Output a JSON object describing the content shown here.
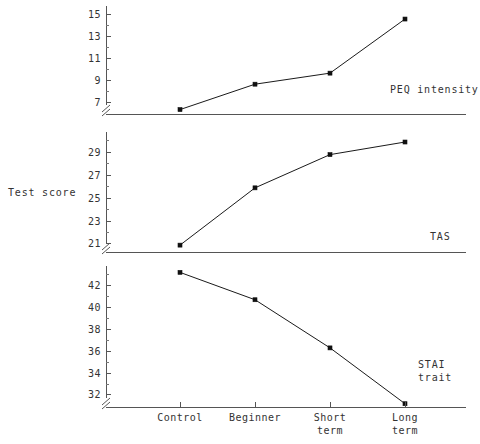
{
  "figure": {
    "y_axis_title": "Test score",
    "background": "#ffffff",
    "line_color": "#1a1a1a",
    "axis_color": "#555555",
    "text_color": "#333333"
  },
  "chart_data": {
    "type": "line",
    "title": "",
    "xlabel": "",
    "ylabel": "Test score",
    "grid": false,
    "legend": "inline-right-panel-labels",
    "categories": [
      "Control",
      "Beginner",
      "Short term",
      "Long term"
    ],
    "category_lines": [
      [
        "Control"
      ],
      [
        "Beginner"
      ],
      [
        "Short",
        "term"
      ],
      [
        "Long",
        "term"
      ]
    ],
    "panels": [
      {
        "name": "PEQ intensity",
        "label": "PEQ intensity",
        "label_lines": [
          "PEQ intensity"
        ],
        "ylim": [
          6.0,
          15.6
        ],
        "yticks": [
          7,
          9,
          11,
          13,
          15
        ],
        "ytick_labels": [
          "7",
          "9",
          "11",
          "13",
          "15"
        ],
        "minor_ticks": [
          8,
          10,
          12,
          14
        ],
        "axis_break": true,
        "values": [
          6.4,
          8.7,
          9.7,
          14.6
        ]
      },
      {
        "name": "TAS",
        "label": "TAS",
        "label_lines": [
          "TAS"
        ],
        "ylim": [
          20.3,
          30.6
        ],
        "yticks": [
          21,
          23,
          25,
          27,
          29
        ],
        "ytick_labels": [
          "21",
          "23",
          "25",
          "27",
          "29"
        ],
        "minor_ticks": [
          22,
          24,
          26,
          28,
          30
        ],
        "axis_break": true,
        "values": [
          20.9,
          25.9,
          28.8,
          29.9
        ]
      },
      {
        "name": "STAI trait",
        "label": "STAI trait",
        "label_lines": [
          "STAI",
          "trait"
        ],
        "ylim": [
          30.9,
          43.6
        ],
        "yticks": [
          32,
          34,
          36,
          38,
          40,
          42
        ],
        "ytick_labels": [
          "32",
          "34",
          "36",
          "38",
          "40",
          "42"
        ],
        "minor_ticks": [
          33,
          35,
          37,
          39,
          41,
          43
        ],
        "axis_break": true,
        "values": [
          43.2,
          40.7,
          36.3,
          31.2
        ]
      }
    ]
  }
}
